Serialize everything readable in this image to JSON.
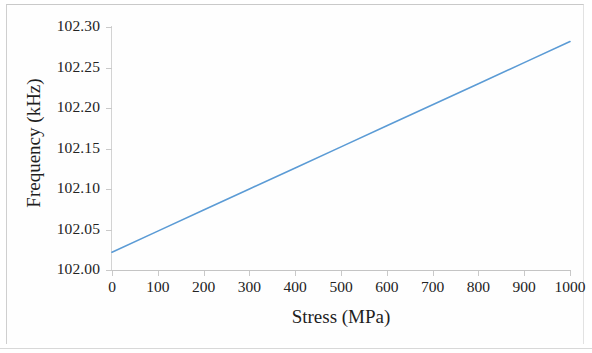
{
  "figure": {
    "background_color": "#ffffff",
    "frame_color": "#cfcfcf"
  },
  "chart_data": {
    "type": "line",
    "title": "",
    "xlabel": "Stress (MPa)",
    "ylabel": "Frequency (kHz)",
    "xlim": [
      0,
      1000
    ],
    "ylim": [
      102.0,
      102.3
    ],
    "grid": false,
    "legend": "none",
    "series": [
      {
        "name": "Frequency vs Stress",
        "color": "#5B9BD5",
        "line_width": 1.6,
        "x": [
          0,
          100,
          200,
          300,
          400,
          500,
          600,
          700,
          800,
          900,
          1000
        ],
        "values": [
          102.022,
          102.048,
          102.074,
          102.1,
          102.126,
          102.152,
          102.178,
          102.204,
          102.23,
          102.256,
          102.282
        ]
      }
    ],
    "x_ticks": [
      {
        "value": 0,
        "label": "0"
      },
      {
        "value": 100,
        "label": "100"
      },
      {
        "value": 200,
        "label": "200"
      },
      {
        "value": 300,
        "label": "300"
      },
      {
        "value": 400,
        "label": "400"
      },
      {
        "value": 500,
        "label": "500"
      },
      {
        "value": 600,
        "label": "600"
      },
      {
        "value": 700,
        "label": "700"
      },
      {
        "value": 800,
        "label": "800"
      },
      {
        "value": 900,
        "label": "900"
      },
      {
        "value": 1000,
        "label": "1000"
      }
    ],
    "y_ticks": [
      {
        "value": 102.3,
        "label": "102.30"
      },
      {
        "value": 102.25,
        "label": "102.25"
      },
      {
        "value": 102.2,
        "label": "102.20"
      },
      {
        "value": 102.15,
        "label": "102.15"
      },
      {
        "value": 102.1,
        "label": "102.10"
      },
      {
        "value": 102.05,
        "label": "102.05"
      },
      {
        "value": 102.0,
        "label": "102.00"
      }
    ]
  }
}
